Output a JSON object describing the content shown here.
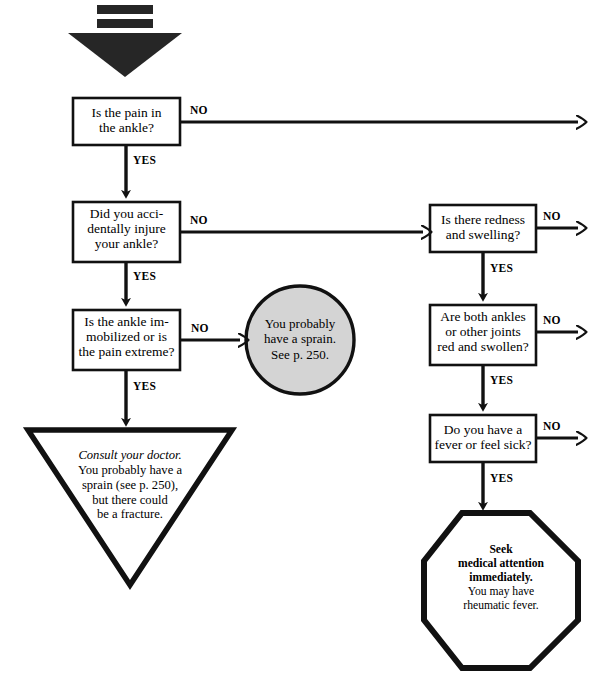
{
  "page": {
    "width": 599,
    "height": 681,
    "background_color": "#ffffff",
    "line_color": "#111111",
    "accent_fill": "#d4d4d4"
  },
  "header": {
    "marker_name": "down-arrow-start-marker",
    "bars": 2
  },
  "labels": {
    "yes": "YES",
    "no": "NO"
  },
  "nodes": {
    "q1": {
      "id": "q1",
      "shape": "rect",
      "lines": [
        "Is the pain in",
        "the ankle?"
      ],
      "yes_label": "YES",
      "no_label": "NO"
    },
    "q2": {
      "id": "q2",
      "shape": "rect",
      "lines": [
        "Did you acci-",
        "dentally injure",
        "your ankle?"
      ],
      "yes_label": "YES",
      "no_label": "NO"
    },
    "q3": {
      "id": "q3",
      "shape": "rect",
      "lines": [
        "Is the ankle im-",
        "mobilized or is",
        "the pain extreme?"
      ],
      "yes_label": "YES",
      "no_label": "NO"
    },
    "q4": {
      "id": "q4",
      "shape": "rect",
      "lines": [
        "Is there redness",
        "and swelling?"
      ],
      "yes_label": "YES",
      "no_label": "NO"
    },
    "q5": {
      "id": "q5",
      "shape": "rect",
      "lines": [
        "Are both ankles",
        "or other joints",
        "red and swollen?"
      ],
      "yes_label": "YES",
      "no_label": "NO"
    },
    "q6": {
      "id": "q6",
      "shape": "rect",
      "lines": [
        "Do you have a",
        "fever or feel sick?"
      ],
      "yes_label": "YES",
      "no_label": "NO"
    },
    "sprain": {
      "id": "sprain",
      "shape": "ellipse",
      "fill": "#d4d4d4",
      "lines": [
        "You probably",
        "have a sprain.",
        "See p. 250."
      ]
    },
    "doctor": {
      "id": "doctor",
      "shape": "triangle-down",
      "emphasis_line": "Consult your doctor.",
      "lines": [
        "You probably have a",
        "sprain (see p. 250),",
        "but there could",
        "be a fracture."
      ]
    },
    "seek": {
      "id": "seek",
      "shape": "octagon",
      "bold_lines": [
        "Seek",
        "medical attention",
        "immediately."
      ],
      "lines": [
        "You may have",
        "rheumatic fever."
      ]
    }
  }
}
